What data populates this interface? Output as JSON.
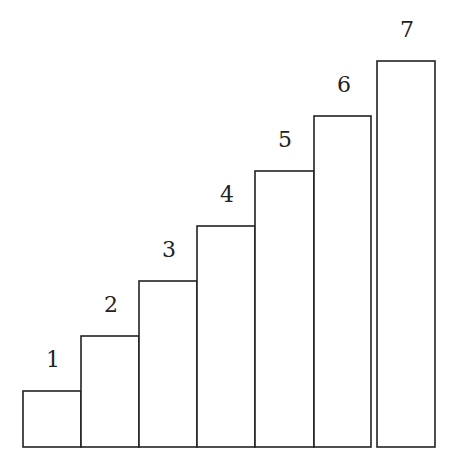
{
  "chart_data": {
    "type": "bar",
    "title": "",
    "categories": [
      "1",
      "2",
      "3",
      "4",
      "5",
      "6",
      "7"
    ],
    "values": [
      1,
      2,
      3,
      4,
      5,
      6,
      7
    ],
    "xlabel": "",
    "ylabel": "",
    "grid": false,
    "legend": null,
    "style": {
      "fill": "#ffffff",
      "stroke": "#222222"
    }
  },
  "labels": [
    "1",
    "2",
    "3",
    "4",
    "5",
    "6",
    "7"
  ],
  "bars": [
    {
      "x": 23,
      "top": 391
    },
    {
      "x": 81,
      "top": 336
    },
    {
      "x": 139,
      "top": 281
    },
    {
      "x": 197,
      "top": 226
    },
    {
      "x": 255,
      "top": 171
    },
    {
      "x": 314,
      "top": 116
    },
    {
      "x": 377,
      "top": 61
    }
  ]
}
